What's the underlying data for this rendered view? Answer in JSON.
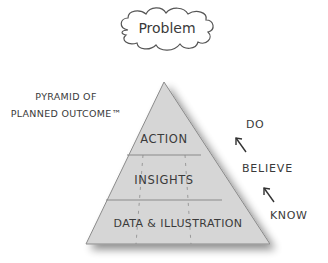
{
  "problem": {
    "label": "Problem"
  },
  "title": {
    "line1": "PYRAMID OF",
    "line2": "PLANNED OUTCOME™"
  },
  "pyramid": {
    "levels": [
      {
        "label": "ACTION"
      },
      {
        "label": "INSIGHTS"
      },
      {
        "label": "DATA & ILLUSTRATION"
      }
    ]
  },
  "progression": {
    "steps": [
      {
        "label": "DO"
      },
      {
        "label": "BELIEVE"
      },
      {
        "label": "KNOW"
      }
    ]
  },
  "colors": {
    "pyramid_fill": "#d6d6d6",
    "pyramid_stroke": "#8a8a8a",
    "text": "#3a3a3a"
  }
}
